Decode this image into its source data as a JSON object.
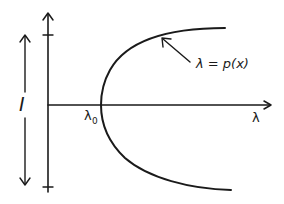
{
  "diagram": {
    "type": "bifurcation-sketch",
    "axes": {
      "horizontal_label": "λ",
      "vertical_axis": "x"
    },
    "interval": {
      "label": "I"
    },
    "critical_point": {
      "label_main": "λ",
      "label_sub": "0"
    },
    "curve": {
      "label": "λ = p(x)"
    },
    "colors": {
      "ink": "#1a1a1a",
      "background": "#ffffff"
    }
  }
}
